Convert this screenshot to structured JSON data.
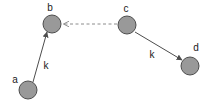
{
  "figure": {
    "type": "directed-graph-diagram",
    "width": 210,
    "height": 104,
    "background_color": "#ffffff"
  },
  "style": {
    "node_fill": "#999999",
    "node_stroke": "#4d4d4d",
    "node_radius": 9,
    "edge_color": "#4d4d4d",
    "dashed_edge_color": "#8c8c8c",
    "label_color": "#1a1a1a"
  },
  "nodes": [
    {
      "id": "a",
      "label": "a",
      "cx": 28,
      "cy": 90,
      "label_x": 15,
      "label_y": 83
    },
    {
      "id": "b",
      "label": "b",
      "cx": 52,
      "cy": 24,
      "label_x": 50,
      "label_y": 11
    },
    {
      "id": "c",
      "label": "c",
      "cx": 127,
      "cy": 25,
      "label_x": 126,
      "label_y": 12
    },
    {
      "id": "d",
      "label": "d",
      "cx": 190,
      "cy": 66,
      "label_x": 196,
      "label_y": 51
    }
  ],
  "edges": [
    {
      "id": "a-to-b",
      "from": "a",
      "to": "b",
      "style": "solid",
      "arrowhead": "filled",
      "label": "k",
      "label_x": 46,
      "label_y": 69,
      "x1": 33,
      "y1": 82,
      "x2": 47,
      "y2": 32
    },
    {
      "id": "c-to-b",
      "from": "c",
      "to": "b",
      "style": "dashed",
      "arrowhead": "open",
      "label": "",
      "label_x": 0,
      "label_y": 0,
      "x1": 117,
      "y1": 24,
      "x2": 62,
      "y2": 24
    },
    {
      "id": "c-to-d",
      "from": "c",
      "to": "d",
      "style": "solid",
      "arrowhead": "filled",
      "label": "k",
      "label_x": 152,
      "label_y": 58,
      "x1": 135,
      "y1": 32,
      "x2": 182,
      "y2": 60
    }
  ]
}
